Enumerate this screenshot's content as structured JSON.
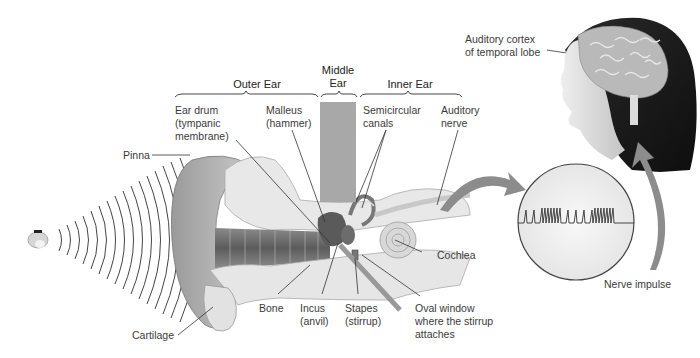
{
  "figure": {
    "sections": {
      "outer_ear": "Outer Ear",
      "middle_ear": "Middle\nEar",
      "inner_ear": "Inner Ear"
    },
    "labels": {
      "ear_drum": "Ear drum\n(tympanic\nmembrane)",
      "malleus": "Malleus\n(hammer)",
      "semicircular": "Semicircular\ncanals",
      "auditory_nerve": "Auditory\nnerve",
      "pinna": "Pinna",
      "cochlea": "Cochlea",
      "bone": "Bone",
      "incus": "Incus\n(anvil)",
      "stapes": "Stapes\n(stirrup)",
      "oval_window": "Oval window\nwhere the stirrup\nattaches",
      "cartilage": "Cartilage",
      "auditory_cortex": "Auditory cortex\nof temporal lobe",
      "nerve_impulse": "Nerve impulse"
    },
    "colors": {
      "line": "#3a3a3a",
      "middle_ear_column": "#a8a8a8",
      "arrow": "#8c8c8c",
      "bone_fill": "#e4e4e4",
      "hair": "#1e1e1e",
      "skin": "#dcdcdc",
      "brain": "#b9b9b9"
    }
  }
}
